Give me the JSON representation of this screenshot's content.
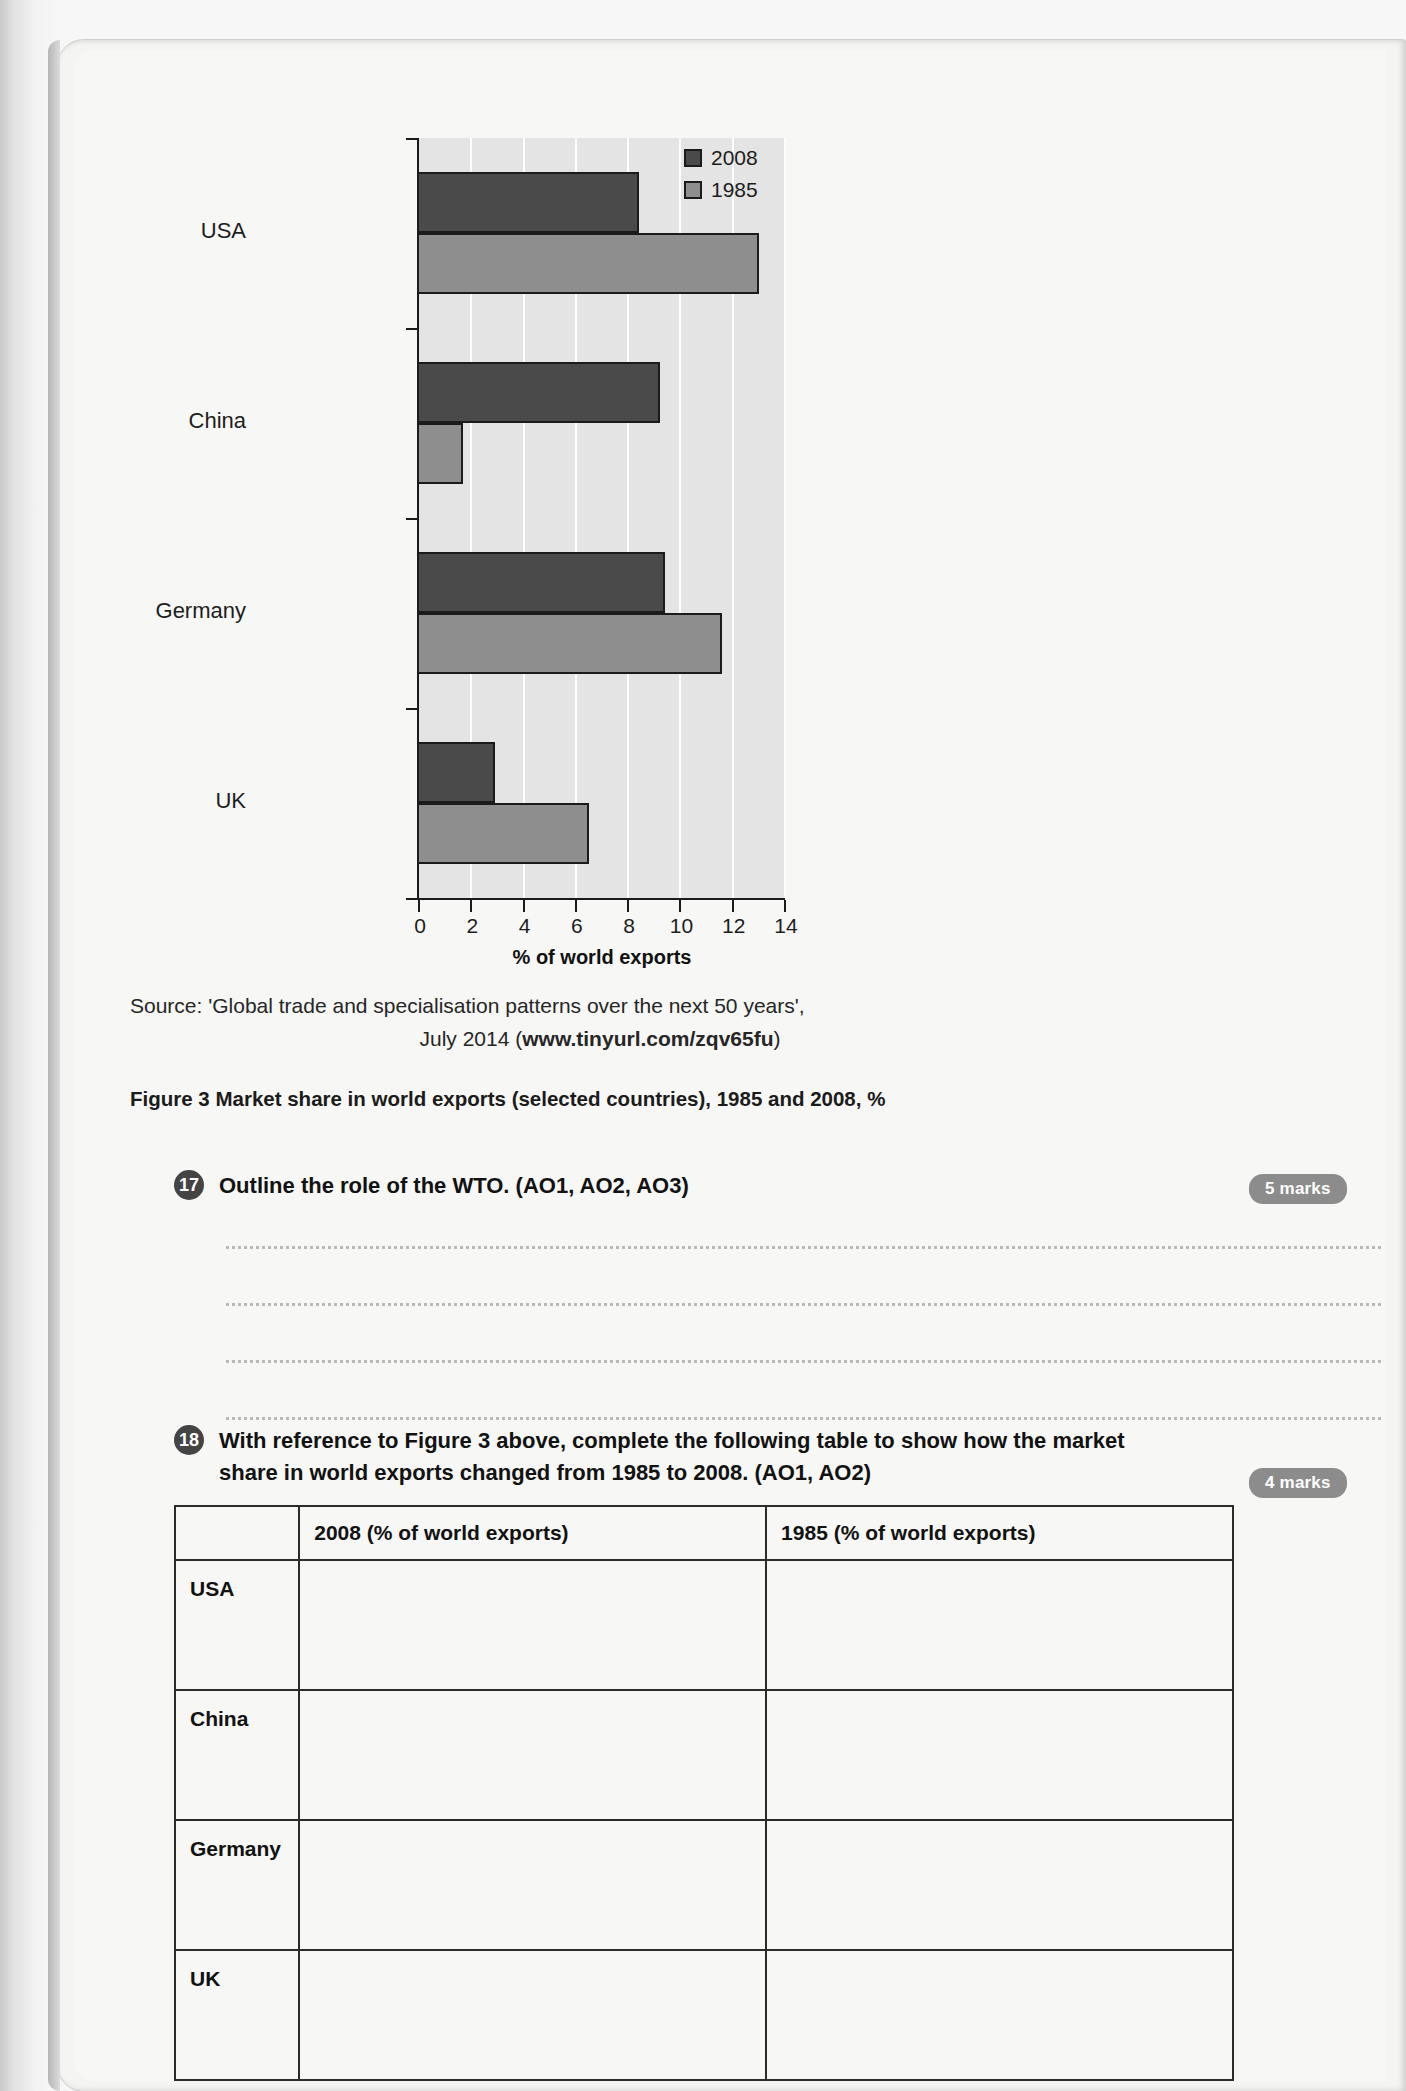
{
  "chart_data": {
    "type": "bar",
    "orientation": "horizontal",
    "title": "",
    "categories": [
      "USA",
      "China",
      "Germany",
      "UK"
    ],
    "series": [
      {
        "name": "2008",
        "color": "#4a4a4a",
        "values": [
          8.4,
          9.2,
          9.4,
          2.9
        ]
      },
      {
        "name": "1985",
        "color": "#8e8e8e",
        "values": [
          13.0,
          1.7,
          11.6,
          6.5
        ]
      }
    ],
    "xlabel": "% of world exports",
    "ylabel": "",
    "xlim": [
      0,
      14
    ],
    "xticks": [
      0,
      2,
      4,
      6,
      8,
      10,
      12,
      14
    ],
    "xticklabels": [
      "0",
      "2",
      "4",
      "6",
      "8",
      "10",
      "12",
      "14"
    ],
    "grid": true,
    "legend_position": "top-right",
    "legend": [
      "2008",
      "1985"
    ]
  },
  "source": {
    "line1": "Source: 'Global trade and specialisation patterns over the next 50 years',",
    "line2_prefix": "July 2014 (",
    "line2_url": "www.tinyurl.com/zqv65fu",
    "line2_suffix": ")"
  },
  "figure_caption": "Figure 3 Market share in world exports (selected countries), 1985 and 2008, %",
  "questions": [
    {
      "number": "17",
      "text": "Outline the role of the WTO. (AO1, AO2, AO3)",
      "marks": "5 marks"
    },
    {
      "number": "18",
      "text": "With reference to Figure 3 above, complete the following table to show how the market share in world exports changed from 1985 to 2008. (AO1, AO2)",
      "marks": "4 marks"
    }
  ],
  "answer_table": {
    "headers": [
      "",
      "2008 (% of world exports)",
      "1985 (% of world exports)"
    ],
    "rows": [
      {
        "label": "USA",
        "col2008": "",
        "col1985": ""
      },
      {
        "label": "China",
        "col2008": "",
        "col1985": ""
      },
      {
        "label": "Germany",
        "col2008": "",
        "col1985": ""
      },
      {
        "label": "UK",
        "col2008": "",
        "col1985": ""
      }
    ]
  }
}
